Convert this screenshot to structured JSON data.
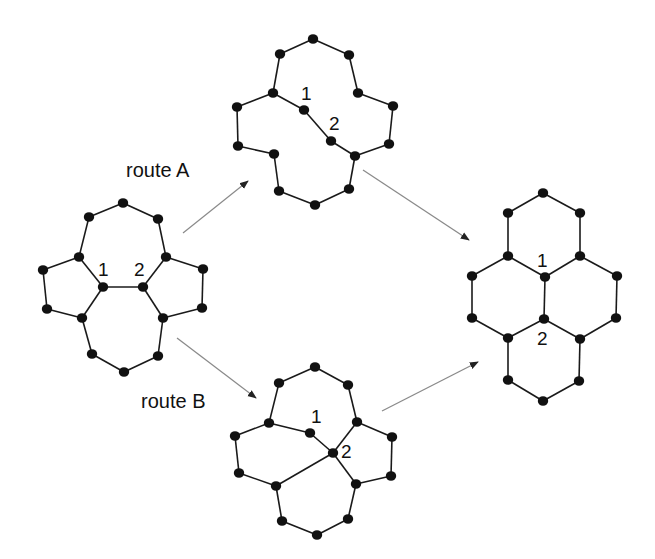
{
  "diagram": {
    "title": "",
    "routes": [
      {
        "id": "A",
        "label": "route A",
        "x": 126,
        "y": 177
      },
      {
        "id": "B",
        "label": "route B",
        "x": 141,
        "y": 408
      }
    ],
    "arrows": [
      {
        "name": "arrow-start-to-routeA",
        "from": [
          183,
          233
        ],
        "to": [
          248,
          181
        ]
      },
      {
        "name": "arrow-start-to-routeB",
        "from": [
          177,
          338
        ],
        "to": [
          256,
          398
        ]
      },
      {
        "name": "arrow-routeA-to-product",
        "from": [
          363,
          170
        ],
        "to": [
          469,
          240
        ]
      },
      {
        "name": "arrow-routeB-to-product",
        "from": [
          382,
          411
        ],
        "to": [
          478,
          362
        ]
      }
    ],
    "molecules": [
      {
        "name": "reactant-molecule",
        "atoms": [
          [
            123,
            203
          ],
          [
            89,
            217
          ],
          [
            158,
            219
          ],
          [
            79,
            257
          ],
          [
            166,
            257
          ],
          [
            43,
            270
          ],
          [
            203,
            269
          ],
          [
            103,
            287
          ],
          [
            143,
            287
          ],
          [
            47,
            309
          ],
          [
            202,
            308
          ],
          [
            82,
            318
          ],
          [
            163,
            318
          ],
          [
            92,
            354
          ],
          [
            158,
            356
          ],
          [
            124,
            372
          ]
        ],
        "bonds": [
          [
            0,
            1
          ],
          [
            0,
            2
          ],
          [
            1,
            3
          ],
          [
            2,
            4
          ],
          [
            3,
            5
          ],
          [
            3,
            7
          ],
          [
            4,
            6
          ],
          [
            4,
            8
          ],
          [
            7,
            8
          ],
          [
            5,
            9
          ],
          [
            6,
            10
          ],
          [
            9,
            11
          ],
          [
            10,
            12
          ],
          [
            7,
            11
          ],
          [
            8,
            12
          ],
          [
            11,
            13
          ],
          [
            12,
            14
          ],
          [
            13,
            15
          ],
          [
            14,
            15
          ]
        ],
        "labels": [
          {
            "text": "1",
            "x": 98,
            "y": 276
          },
          {
            "text": "2",
            "x": 134,
            "y": 276
          }
        ]
      },
      {
        "name": "route-a-intermediate",
        "atoms": [
          [
            313,
            39
          ],
          [
            280,
            54
          ],
          [
            349,
            55
          ],
          [
            273,
            93
          ],
          [
            358,
            93
          ],
          [
            304,
            110
          ],
          [
            237,
            107
          ],
          [
            393,
            106
          ],
          [
            331,
            141
          ],
          [
            238,
            146
          ],
          [
            389,
            144
          ],
          [
            274,
            154
          ],
          [
            355,
            156
          ],
          [
            279,
            191
          ],
          [
            349,
            189
          ],
          [
            315,
            205
          ]
        ],
        "bonds": [
          [
            0,
            1
          ],
          [
            0,
            2
          ],
          [
            1,
            3
          ],
          [
            2,
            4
          ],
          [
            3,
            5
          ],
          [
            5,
            8
          ],
          [
            8,
            12
          ],
          [
            3,
            6
          ],
          [
            6,
            9
          ],
          [
            9,
            11
          ],
          [
            11,
            13
          ],
          [
            13,
            15
          ],
          [
            15,
            14
          ],
          [
            14,
            12
          ],
          [
            4,
            7
          ],
          [
            7,
            10
          ],
          [
            10,
            12
          ]
        ],
        "labels": [
          {
            "text": "1",
            "x": 301,
            "y": 100
          },
          {
            "text": "2",
            "x": 329,
            "y": 130
          }
        ]
      },
      {
        "name": "route-b-intermediate",
        "atoms": [
          [
            315,
            367
          ],
          [
            279,
            383
          ],
          [
            348,
            385
          ],
          [
            269,
            423
          ],
          [
            357,
            422
          ],
          [
            310,
            433
          ],
          [
            333,
            453
          ],
          [
            235,
            436
          ],
          [
            392,
            437
          ],
          [
            239,
            473
          ],
          [
            391,
            476
          ],
          [
            276,
            486
          ],
          [
            356,
            484
          ],
          [
            282,
            521
          ],
          [
            348,
            519
          ],
          [
            317,
            535
          ]
        ],
        "bonds": [
          [
            0,
            1
          ],
          [
            0,
            2
          ],
          [
            1,
            3
          ],
          [
            2,
            4
          ],
          [
            3,
            5
          ],
          [
            5,
            6
          ],
          [
            3,
            7
          ],
          [
            7,
            9
          ],
          [
            9,
            11
          ],
          [
            4,
            6
          ],
          [
            4,
            8
          ],
          [
            8,
            10
          ],
          [
            10,
            12
          ],
          [
            6,
            11
          ],
          [
            6,
            12
          ],
          [
            11,
            13
          ],
          [
            13,
            15
          ],
          [
            15,
            14
          ],
          [
            14,
            12
          ]
        ],
        "labels": [
          {
            "text": "1",
            "x": 311,
            "y": 423
          },
          {
            "text": "2",
            "x": 341,
            "y": 458
          }
        ]
      },
      {
        "name": "product-molecule",
        "atoms": [
          [
            543,
            193
          ],
          [
            508,
            213
          ],
          [
            580,
            213
          ],
          [
            508,
            256
          ],
          [
            580,
            256
          ],
          [
            545,
            277
          ],
          [
            472,
            276
          ],
          [
            617,
            276
          ],
          [
            472,
            318
          ],
          [
            616,
            318
          ],
          [
            544,
            319
          ],
          [
            508,
            338
          ],
          [
            580,
            339
          ],
          [
            508,
            380
          ],
          [
            579,
            381
          ],
          [
            543,
            401
          ]
        ],
        "bonds": [
          [
            0,
            1
          ],
          [
            0,
            2
          ],
          [
            1,
            3
          ],
          [
            2,
            4
          ],
          [
            3,
            5
          ],
          [
            4,
            5
          ],
          [
            3,
            6
          ],
          [
            4,
            7
          ],
          [
            6,
            8
          ],
          [
            7,
            9
          ],
          [
            5,
            10
          ],
          [
            8,
            11
          ],
          [
            9,
            12
          ],
          [
            10,
            11
          ],
          [
            10,
            12
          ],
          [
            11,
            13
          ],
          [
            12,
            14
          ],
          [
            13,
            15
          ],
          [
            14,
            15
          ]
        ],
        "labels": [
          {
            "text": "1",
            "x": 537,
            "y": 267
          },
          {
            "text": "2",
            "x": 537,
            "y": 345
          }
        ]
      }
    ]
  },
  "style": {
    "atom_color": "#111111",
    "bond_color": "#1a1a1a",
    "arrow_color": "#8a8a8a",
    "background": "#ffffff"
  }
}
